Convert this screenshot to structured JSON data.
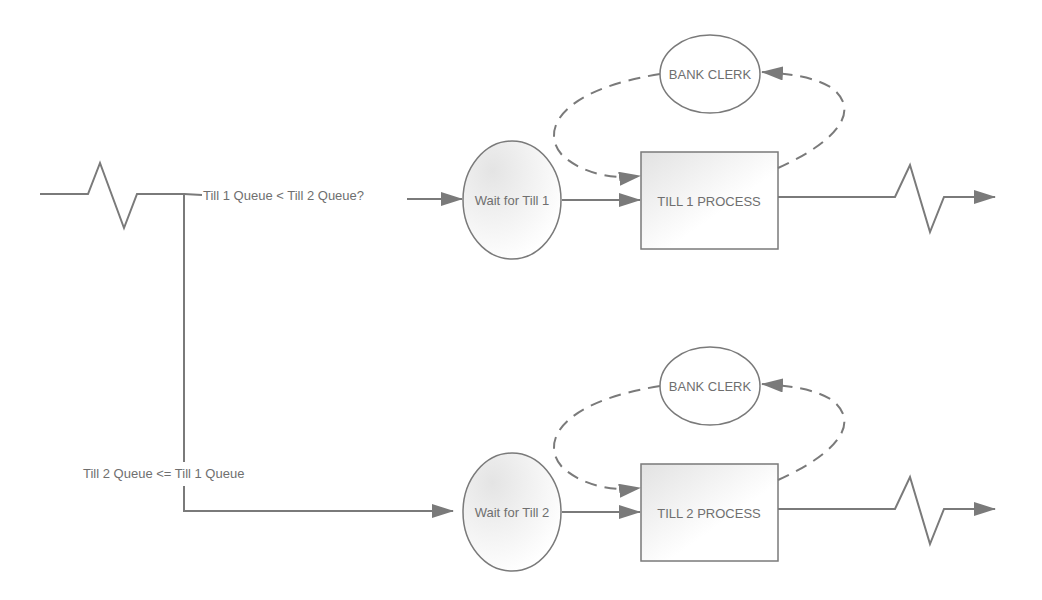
{
  "diagram": {
    "type": "queue-process-flow",
    "colors": {
      "stroke": "#7a7a7a",
      "text": "#6f6f6f",
      "fill_gradient_start": "#e6e6e6",
      "fill_gradient_end": "#ffffff"
    },
    "branch_labels": {
      "top": "Till 1 Queue < Till 2 Queue?",
      "bottom": "Till 2 Queue <= Till 1 Queue"
    },
    "lanes": [
      {
        "queue_label": "Wait for Till 1",
        "process_label": "TILL 1 PROCESS",
        "resource_label": "BANK CLERK"
      },
      {
        "queue_label": "Wait for Till 2",
        "process_label": "TILL 2 PROCESS",
        "resource_label": "BANK CLERK"
      }
    ],
    "symbols": {
      "entry": "zigzag-arrival",
      "exit": "zigzag-departure"
    }
  }
}
